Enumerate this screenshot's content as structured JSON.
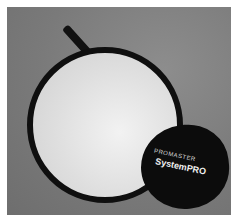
{
  "photo": {
    "subject": "collapsible circular light reflector with storage pouch",
    "background_color": "#7c7c7c",
    "reflector": {
      "rim_color": "#0f0f0f",
      "surface_color": "#e4e4e4"
    },
    "pouch": {
      "color": "#0c0c0c",
      "brand_text": "PROMASTER",
      "model_text": "SystemPRO"
    }
  }
}
